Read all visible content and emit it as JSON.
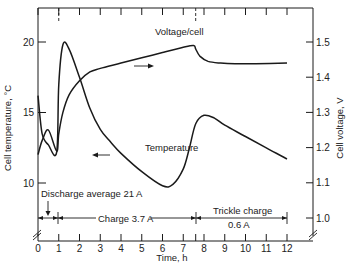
{
  "chart_data": {
    "type": "line",
    "title": "",
    "xlabel": "Time, h",
    "ylabel_left": "Cell temperature, °C",
    "ylabel_right": "Cell voltage, V",
    "xlim": [
      0,
      12
    ],
    "ylim_left": [
      10,
      20
    ],
    "ylim_right": [
      1.0,
      1.5
    ],
    "x_ticks": [
      "0",
      "1",
      "2",
      "3",
      "4",
      "5",
      "6",
      "7",
      "8",
      "9",
      "10",
      "11",
      "12"
    ],
    "y_ticks_left": [
      "10",
      "15",
      "20"
    ],
    "y_ticks_right": [
      "1.0",
      "1.1",
      "1.2",
      "1.3",
      "1.4",
      "1.5"
    ],
    "grid": false,
    "series": [
      {
        "name": "Voltage/cell",
        "axis": "right",
        "x": [
          0.0,
          0.2,
          0.5,
          0.9,
          1.0,
          1.2,
          1.5,
          2.0,
          2.5,
          3.0,
          4.0,
          5.0,
          6.0,
          7.0,
          7.5,
          7.6,
          7.8,
          8.2,
          8.8,
          9.5,
          10.5,
          12.0
        ],
        "values": [
          1.18,
          1.22,
          1.25,
          1.19,
          1.24,
          1.3,
          1.35,
          1.39,
          1.415,
          1.425,
          1.44,
          1.455,
          1.47,
          1.485,
          1.49,
          1.48,
          1.46,
          1.445,
          1.44,
          1.438,
          1.438,
          1.44
        ]
      },
      {
        "name": "Temperature",
        "axis": "left",
        "x": [
          0.0,
          0.2,
          0.5,
          0.9,
          1.0,
          1.2,
          1.5,
          2.0,
          2.5,
          3.0,
          3.5,
          4.0,
          5.0,
          6.0,
          6.5,
          7.0,
          7.3,
          7.6,
          8.0,
          8.5,
          9.0,
          10.0,
          11.0,
          12.0
        ],
        "values": [
          16.2,
          13.5,
          12.7,
          12.2,
          17.0,
          19.8,
          19.5,
          17.5,
          15.3,
          13.8,
          12.9,
          12.1,
          10.8,
          9.8,
          9.9,
          11.0,
          12.5,
          14.2,
          14.8,
          14.6,
          14.1,
          13.3,
          12.5,
          11.7
        ]
      }
    ],
    "annotations": [
      {
        "text": "Voltage/cell",
        "arrow": "right"
      },
      {
        "text": "Temperature",
        "arrow": "left"
      },
      {
        "text": "Discharge average 21 A",
        "x_range": [
          0,
          1
        ]
      },
      {
        "text": "Charge 3.7 A",
        "x_range": [
          1,
          7.6
        ]
      },
      {
        "text": "Trickle charge",
        "x_range": [
          7.6,
          12
        ]
      },
      {
        "text": "0.6 A",
        "x_range": [
          7.6,
          12
        ]
      }
    ]
  },
  "labels": {
    "xlabel": "Time, h",
    "ylabel_left": "Cell temperature, °C",
    "ylabel_right": "Cell voltage, V",
    "voltage_curve": "Voltage/cell",
    "temperature_curve": "Temperature",
    "discharge": "Discharge average 21 A",
    "charge": "Charge 3.7 A",
    "trickle_line1": "Trickle charge",
    "trickle_line2": "0.6 A"
  }
}
